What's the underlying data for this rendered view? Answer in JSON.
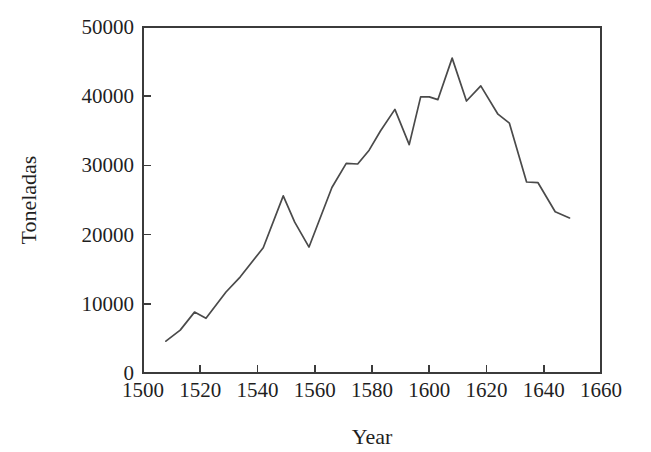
{
  "chart_data": {
    "type": "line",
    "title": "",
    "xlabel": "Year",
    "ylabel": "Toneladas",
    "xlim": [
      1500,
      1660
    ],
    "ylim": [
      0,
      50000
    ],
    "xticks": [
      1500,
      1520,
      1540,
      1560,
      1580,
      1600,
      1620,
      1640,
      1660
    ],
    "yticks": [
      0,
      10000,
      20000,
      30000,
      40000,
      50000
    ],
    "xtick_labels": [
      "1500",
      "1520",
      "1540",
      "1560",
      "1580",
      "1600",
      "1620",
      "1640",
      "1660"
    ],
    "ytick_labels": [
      "0",
      "10000",
      "20000",
      "30000",
      "40000",
      "50000"
    ],
    "grid": false,
    "legend": "none",
    "line_color": "#4a4a4a",
    "series": [
      {
        "name": "Toneladas",
        "x": [
          1508,
          1513,
          1518,
          1522,
          1529,
          1534,
          1542,
          1549,
          1553,
          1558,
          1566,
          1571,
          1575,
          1579,
          1583,
          1588,
          1593,
          1597,
          1600,
          1603,
          1608,
          1613,
          1618,
          1624,
          1628,
          1634,
          1638,
          1644,
          1649
        ],
        "y": [
          4600,
          6200,
          8800,
          7900,
          11700,
          13900,
          18100,
          25600,
          21800,
          18200,
          26800,
          30300,
          30200,
          32200,
          35000,
          38100,
          33000,
          39900,
          39900,
          39500,
          45500,
          39300,
          41500,
          37400,
          36100,
          27600,
          27500,
          23300,
          22400
        ]
      }
    ]
  }
}
